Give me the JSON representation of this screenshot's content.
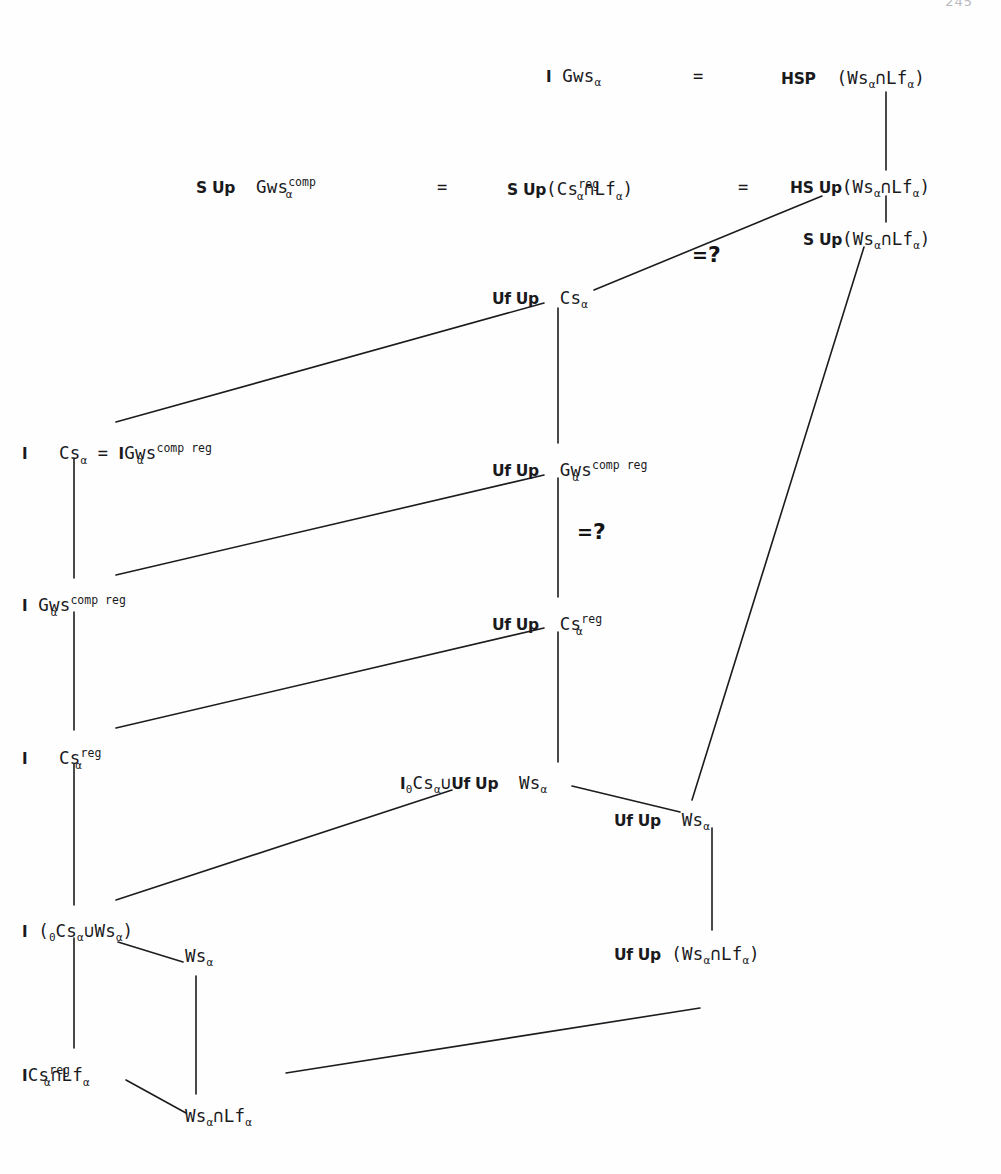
{
  "page": {
    "number": "245",
    "running_head": "",
    "width": 1001,
    "height": 1174,
    "ink_color": "#1a1a1d",
    "paper_color": "#fefefe"
  },
  "diagram": {
    "type": "lattice-commutative-diagram",
    "relation_marker": "=?",
    "nodes": [
      {
        "id": "n1",
        "label": "I Gwsα = HSP (Wsα ∩ Lfα)",
        "parts": [
          {
            "kind": "ident",
            "text": "I"
          },
          {
            "kind": "cls",
            "text": "Gws",
            "sub": "α"
          },
          {
            "kind": "eq",
            "text": "="
          },
          {
            "kind": "op",
            "text": "HSP"
          },
          {
            "kind": "cls",
            "text": "(Ws",
            "sub": "α"
          },
          {
            "kind": "cls",
            "text": "∩Lf",
            "sub": "α"
          },
          {
            "kind": "cls",
            "text": ")"
          }
        ],
        "x": 546,
        "y": 68
      },
      {
        "id": "n2",
        "label": "S Up Gwsα comp = S Up (Csα reg ∩ Lfα) = HS Up (Wsα ∩ Lfα)",
        "x": 196,
        "y": 177
      },
      {
        "id": "n3",
        "label": "S Up (Wsα ∩ Lfα)",
        "x": 800,
        "y": 231
      },
      {
        "id": "n4",
        "label": "Uf Up Csα",
        "x": 492,
        "y": 290
      },
      {
        "id": "n5",
        "label": "I Csα = I Gwsα comp reg",
        "x": 22,
        "y": 440
      },
      {
        "id": "n6",
        "label": "Uf Up Gwsα comp reg",
        "x": 492,
        "y": 460
      },
      {
        "id": "n7",
        "label": "I Gwsα comp reg",
        "x": 22,
        "y": 592
      },
      {
        "id": "n8",
        "label": "Uf Up Csα reg",
        "x": 492,
        "y": 614
      },
      {
        "id": "n9",
        "label": "I Csα reg",
        "x": 22,
        "y": 745
      },
      {
        "id": "n10",
        "label": "I0 Csα ∪ Uf Up Wsα",
        "x": 400,
        "y": 775
      },
      {
        "id": "n11",
        "label": "Uf Up Wsα",
        "x": 614,
        "y": 812
      },
      {
        "id": "n12",
        "label": "I (0Csα ∪ Wsα)",
        "x": 22,
        "y": 920
      },
      {
        "id": "n13",
        "label": "Wsα",
        "x": 185,
        "y": 945
      },
      {
        "id": "n14",
        "label": "Uf Up (Wsα ∩ Lfα)",
        "x": 614,
        "y": 945
      },
      {
        "id": "n15",
        "label": "I Csα reg ∩ Lfα",
        "x": 22,
        "y": 1062
      },
      {
        "id": "n16",
        "label": "Wsα ∩ Lfα",
        "x": 185,
        "y": 1105
      }
    ],
    "markers": [
      {
        "id": "m1",
        "text": "=",
        "question": "?",
        "x": 692,
        "y": 248
      },
      {
        "id": "m2",
        "text": "=",
        "question": "?",
        "x": 560,
        "y": 520
      }
    ],
    "text": {
      "I": "I",
      "I0": "I",
      "sub_zero": "0",
      "alpha": "α",
      "Gws": "Gws",
      "Cs": "Cs",
      "Ws": "Ws",
      "Lf": "Lf",
      "comp": "comp",
      "reg": "reg",
      "comp_reg": "comp reg",
      "eq": "=",
      "cap": "∩",
      "cup": "∪",
      "lparen": "(",
      "rparen": ")",
      "op_S_Up": "S Up",
      "op_HS_Up": "HS Up",
      "op_HSP": "HSP",
      "op_Uf_Up": "Uf Up",
      "question_mark": "?"
    }
  }
}
